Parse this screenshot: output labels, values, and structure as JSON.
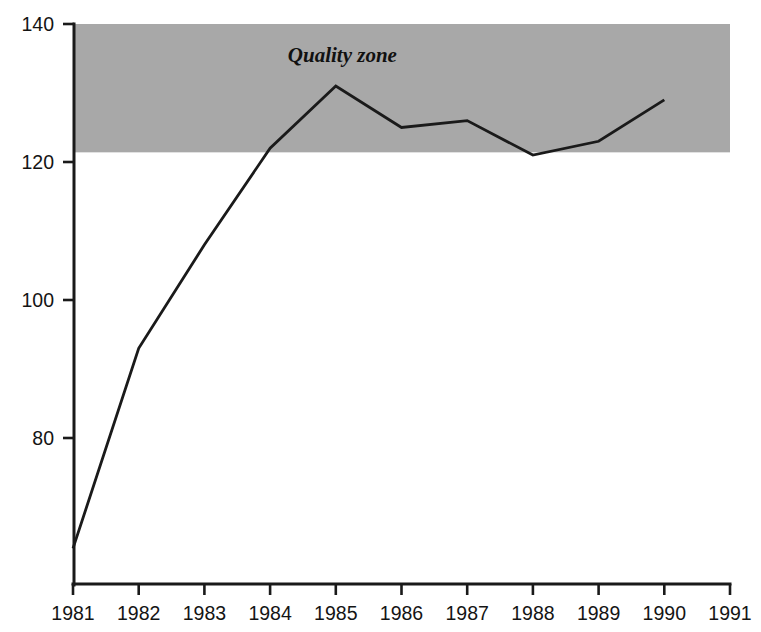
{
  "chart_data": {
    "type": "line",
    "title": "",
    "subtitle": "",
    "xlabel": "",
    "ylabel": "",
    "x": [
      1981,
      1982,
      1983,
      1984,
      1985,
      1986,
      1987,
      1988,
      1989,
      1990
    ],
    "categories": [
      "1981",
      "1982",
      "1983",
      "1984",
      "1985",
      "1986",
      "1987",
      "1988",
      "1989",
      "1990"
    ],
    "values": [
      64,
      93,
      108,
      122,
      131,
      125,
      126,
      121,
      123,
      129
    ],
    "series": [
      {
        "name": "",
        "values": [
          64,
          93,
          108,
          122,
          131,
          125,
          126,
          121,
          123,
          129
        ]
      }
    ],
    "xlim": [
      1981,
      1991
    ],
    "ylim": [
      62,
      140
    ],
    "x_ticks": [
      "1981",
      "1982",
      "1983",
      "1984",
      "1985",
      "1986",
      "1987",
      "1988",
      "1989",
      "1990",
      "1991"
    ],
    "x_tick_values": [
      1981,
      1982,
      1983,
      1984,
      1985,
      1986,
      1987,
      1988,
      1989,
      1990,
      1991
    ],
    "y_ticks": [
      "80",
      "100",
      "120",
      "140"
    ],
    "y_tick_values": [
      80,
      100,
      120,
      140
    ],
    "grid": false,
    "legend": "none",
    "annotations": [
      {
        "text": "Quality zone",
        "x": 1985.1,
        "y": 134.5,
        "style": "italic-serif"
      }
    ],
    "shaded_bands": [
      {
        "label": "Quality zone",
        "y_min": 121.4,
        "y_max": 140,
        "x_min": 1981,
        "x_max": 1991,
        "color": "#a8a8a8"
      }
    ],
    "colors": {
      "line": "#1a1a1a",
      "axis": "#1a1a1a",
      "band": "#a8a8a8",
      "background": "#ffffff",
      "tick_label": "#141414"
    }
  }
}
